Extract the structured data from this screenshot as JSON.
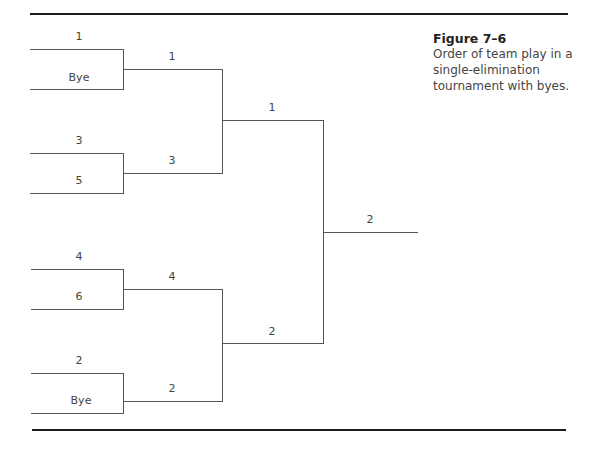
{
  "caption": {
    "figure_label": "Figure 7–6",
    "lines": [
      "Order of team play in a",
      "single-elimination",
      "tournament with byes."
    ]
  },
  "bracket": {
    "round1": [
      {
        "top": "1",
        "bottom": "Bye"
      },
      {
        "top": "3",
        "bottom": "5"
      },
      {
        "top": "4",
        "bottom": "6"
      },
      {
        "top": "2",
        "bottom": "Bye"
      }
    ],
    "round2": [
      "1",
      "3",
      "4",
      "2"
    ],
    "round3": [
      "1",
      "2"
    ],
    "final": "2"
  },
  "colors": {
    "line": "#555555",
    "rule": "#1a1a1a",
    "text": "#444444"
  }
}
